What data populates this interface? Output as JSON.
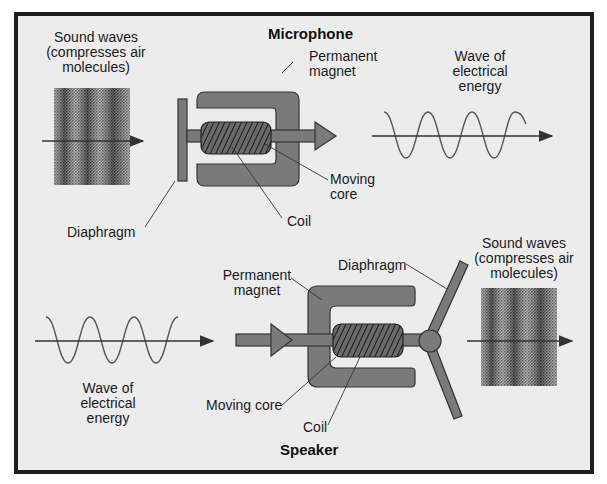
{
  "diagram": {
    "microphone": {
      "title": "Microphone",
      "labels": {
        "sound_waves": "Sound waves\n(compresses air\nmolecules)",
        "permanent_magnet": "Permanent\nmagnet",
        "wave_electrical": "Wave of\nelectrical\nenergy",
        "moving_core": "Moving\ncore",
        "coil": "Coil",
        "diaphragm": "Diaphragm"
      }
    },
    "speaker": {
      "title": "Speaker",
      "labels": {
        "permanent_magnet": "Permanent\nmagnet",
        "diaphragm": "Diaphragm",
        "sound_waves": "Sound waves\n(compresses air\nmolecules)",
        "wave_electrical": "Wave of\nelectrical\nenergy",
        "moving_core": "Moving core",
        "coil": "Coil"
      }
    },
    "colors": {
      "background": "#ececec",
      "frame": "#1e1e1e",
      "component_fill": "#7a7a7a",
      "component_dark": "#5e5e5e",
      "line": "#333333"
    }
  }
}
